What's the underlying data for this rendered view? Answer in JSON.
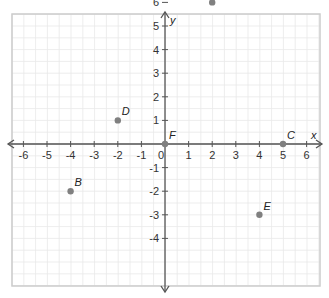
{
  "chart_data": {
    "type": "scatter",
    "title": "",
    "xlabel": "x",
    "ylabel": "y",
    "xlim": [
      -6,
      6
    ],
    "ylim": [
      -4,
      6
    ],
    "grid": true,
    "x_ticks": [
      -6,
      -5,
      -4,
      -3,
      -2,
      -1,
      0,
      1,
      2,
      3,
      4,
      5,
      6
    ],
    "y_ticks": [
      -4,
      -3,
      -2,
      -1,
      1,
      2,
      3,
      4,
      5,
      6
    ],
    "points": [
      {
        "label": "A",
        "x": 2,
        "y": 6
      },
      {
        "label": "B",
        "x": -4,
        "y": -2
      },
      {
        "label": "C",
        "x": 5,
        "y": 0
      },
      {
        "label": "D",
        "x": -2,
        "y": 1
      },
      {
        "label": "E",
        "x": 4,
        "y": -3
      },
      {
        "label": "F",
        "x": 0,
        "y": 0
      }
    ],
    "colors": {
      "point": "#808080",
      "axis": "#555555",
      "grid": "#e8e8e8",
      "border": "#cccccc"
    }
  }
}
